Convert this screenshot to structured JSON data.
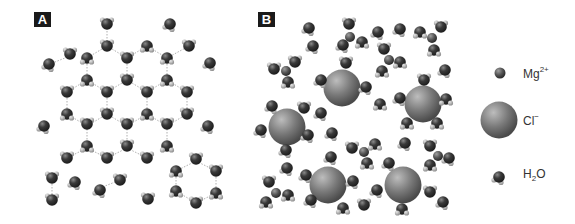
{
  "figure": {
    "panels": [
      {
        "id": "A",
        "label": "A",
        "description": "Ice-like hydrogen-bonded hexagonal network of water molecules"
      },
      {
        "id": "B",
        "label": "B",
        "description": "MgCl2 solution: Mg2+ and Cl- ions surrounded by hydration shells of water"
      }
    ],
    "legend": [
      {
        "symbol": "small-dark-sphere",
        "label_main": "Mg",
        "label_sup": "2+",
        "label_sub": ""
      },
      {
        "symbol": "large-gray-sphere",
        "label_main": "Cl",
        "label_sup": "−",
        "label_sub": ""
      },
      {
        "symbol": "water-molecule",
        "label_main": "H",
        "label_sub": "2",
        "label_tail": "O"
      }
    ],
    "colors": {
      "oxygen": "#3a3a3a",
      "hydrogen": "#b8b8b8",
      "chloride": "#7a7a7a",
      "magnesium": "#555555",
      "label_bg": "#1a1a1a",
      "hbond": "#9a9a9a"
    }
  }
}
